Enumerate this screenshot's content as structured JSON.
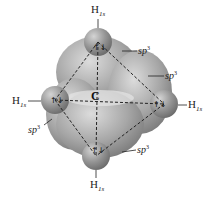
{
  "diagram": {
    "center_atom": "C",
    "hydrogens": [
      {
        "id": "top",
        "symbol": "H",
        "orbital": "1s"
      },
      {
        "id": "left",
        "symbol": "H",
        "orbital": "1s"
      },
      {
        "id": "right",
        "symbol": "H",
        "orbital": "1s"
      },
      {
        "id": "bottom",
        "symbol": "H",
        "orbital": "1s"
      }
    ],
    "hybrid_labels": [
      {
        "id": "upper-right",
        "base": "sp",
        "exp": "3"
      },
      {
        "id": "right",
        "base": "sp",
        "exp": "3"
      },
      {
        "id": "lower-left",
        "base": "sp",
        "exp": "3"
      },
      {
        "id": "lower-right",
        "base": "sp",
        "exp": "3"
      }
    ],
    "electron_pair_glyph": "↑↓",
    "colors": {
      "lobe": "#9a9a9a",
      "lobe_light": "#c8c8c8",
      "sphere": "#8e8e8e",
      "dash": "#222222"
    }
  }
}
